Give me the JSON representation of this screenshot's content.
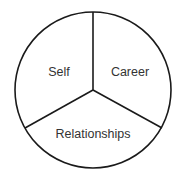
{
  "diagram": {
    "type": "three-segment circle",
    "segments": [
      {
        "label": "Self",
        "position": "upper-left"
      },
      {
        "label": "Career",
        "position": "upper-right"
      },
      {
        "label": "Relationships",
        "position": "bottom"
      }
    ],
    "colors": {
      "stroke": "#1a1a1a",
      "text": "#333333",
      "background": "#ffffff"
    }
  }
}
